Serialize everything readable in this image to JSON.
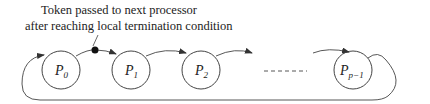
{
  "annotation": {
    "line1": "Token passed to next processor",
    "line2": "after reaching local termination condition"
  },
  "processors": [
    {
      "name": "P",
      "sub": "0",
      "cx": 61
    },
    {
      "name": "P",
      "sub": "1",
      "cx": 131
    },
    {
      "name": "P",
      "sub": "2",
      "cx": 201
    },
    {
      "name": "P",
      "sub": "p−1",
      "cx": 353
    }
  ],
  "ellipsis": "- - - - - -",
  "colors": {
    "stroke": "#444444",
    "token": "#111111"
  }
}
